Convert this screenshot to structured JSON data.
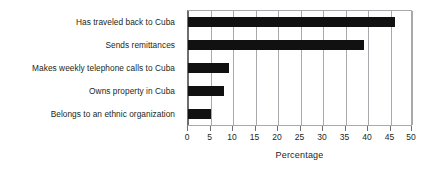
{
  "chart_data": {
    "type": "bar",
    "orientation": "horizontal",
    "title": "",
    "subtitle": "",
    "xlabel": "Percentage",
    "ylabel": "",
    "categories": [
      "Has traveled back to Cuba",
      "Sends remittances",
      "Makes weekly telephone calls to Cuba",
      "Owns property in Cuba",
      "Belongs to an ethnic organization"
    ],
    "values": [
      46,
      39,
      9,
      8,
      5
    ],
    "xlim": [
      0,
      50
    ],
    "xticks": [
      0,
      5,
      10,
      15,
      20,
      25,
      30,
      35,
      40,
      45,
      50
    ],
    "xtick_labels": [
      "0",
      "5",
      "10",
      "15",
      "20",
      "25",
      "30",
      "35",
      "40",
      "45",
      "50"
    ],
    "grid": "vertical",
    "legend": "none",
    "bar_color": "#111111",
    "grid_color": "#a7a9ac",
    "axis_color": "#6d6e71",
    "background": "#ffffff",
    "text_color": "#231f20"
  }
}
